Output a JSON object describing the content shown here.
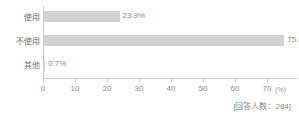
{
  "chart_data": {
    "type": "bar",
    "orientation": "horizontal",
    "title": "",
    "subtitle": "",
    "xlabel": "(%)",
    "ylabel": "",
    "categories": [
      "使用",
      "不使用",
      "其他"
    ],
    "values": [
      23.9,
      75.4,
      0.7
    ],
    "value_labels": [
      "23.9%",
      "75.4%",
      "0.7%"
    ],
    "xlim": [
      0,
      80
    ],
    "xticks": [
      0,
      10,
      20,
      30,
      40,
      50,
      60,
      70,
      80
    ],
    "xtick_labels": [
      "0",
      "10",
      "20",
      "30",
      "40",
      "50",
      "60",
      "70",
      "80"
    ],
    "grid": false,
    "legend": null,
    "annotations": [
      "[回答人数：284]"
    ],
    "series": [
      {
        "name": "",
        "values": [
          23.9,
          75.4,
          0.7
        ],
        "color": "#d2d2d2"
      }
    ]
  },
  "axis": {
    "unit_label": "(%)"
  },
  "footnote": {
    "text": "[回答人数：284]",
    "respondents": 284
  },
  "colors": {
    "bar": "#d2d2d2",
    "axis": "#c9c9c9",
    "label_text": "#6e6e6e",
    "value_text": "#8a8a8a",
    "background": "#ffffff"
  }
}
